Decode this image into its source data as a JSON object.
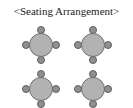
{
  "figure": {
    "title": "<Seating Arrangement>",
    "width": 133,
    "height": 108,
    "background_color": "#ffffff"
  },
  "style": {
    "table_fill": "#b2b2b2",
    "table_stroke": "#6e6e6e",
    "chair_fill": "#909090",
    "chair_stroke": "#5e5e5e",
    "title_color": "#1c1c1c"
  },
  "layout": {
    "rows": 2,
    "columns": 2,
    "tables_total": 4,
    "chairs_per_table": 4
  },
  "tables": [
    {
      "id": "table-1",
      "label": "Table 1",
      "position": "top-left",
      "x": 22,
      "y": 26,
      "chairs": [
        {
          "id": "table-1-chair-north",
          "seat": "north"
        },
        {
          "id": "table-1-chair-east",
          "seat": "east"
        },
        {
          "id": "table-1-chair-south",
          "seat": "south"
        },
        {
          "id": "table-1-chair-west",
          "seat": "west"
        }
      ]
    },
    {
      "id": "table-2",
      "label": "Table 2",
      "position": "top-right",
      "x": 74,
      "y": 26,
      "chairs": [
        {
          "id": "table-2-chair-north",
          "seat": "north"
        },
        {
          "id": "table-2-chair-east",
          "seat": "east"
        },
        {
          "id": "table-2-chair-south",
          "seat": "south"
        },
        {
          "id": "table-2-chair-west",
          "seat": "west"
        }
      ]
    },
    {
      "id": "table-3",
      "label": "Table 3",
      "position": "bottom-left",
      "x": 22,
      "y": 70,
      "chairs": [
        {
          "id": "table-3-chair-north",
          "seat": "north"
        },
        {
          "id": "table-3-chair-east",
          "seat": "east"
        },
        {
          "id": "table-3-chair-south",
          "seat": "south"
        },
        {
          "id": "table-3-chair-west",
          "seat": "west"
        }
      ]
    },
    {
      "id": "table-4",
      "label": "Table 4",
      "position": "bottom-right",
      "x": 74,
      "y": 70,
      "chairs": [
        {
          "id": "table-4-chair-north",
          "seat": "north"
        },
        {
          "id": "table-4-chair-east",
          "seat": "east"
        },
        {
          "id": "table-4-chair-south",
          "seat": "south"
        },
        {
          "id": "table-4-chair-west",
          "seat": "west"
        }
      ]
    }
  ]
}
